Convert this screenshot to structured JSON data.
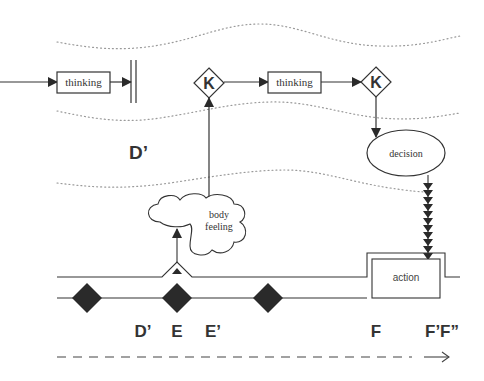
{
  "diagram": {
    "colors": {
      "line": "#333333",
      "fill": "#2a2a2a",
      "dotted": "#9a9a9a",
      "background": "#ffffff"
    },
    "top_row": {
      "nodes": [
        {
          "id": "thinking-1",
          "shape": "rect",
          "label": "thinking"
        },
        {
          "id": "block-bars",
          "shape": "double-bar",
          "label": ""
        },
        {
          "id": "k-1",
          "shape": "diamond",
          "label": "K"
        },
        {
          "id": "thinking-2",
          "shape": "rect",
          "label": "thinking"
        },
        {
          "id": "k-2",
          "shape": "diamond",
          "label": "K"
        }
      ]
    },
    "region_label": "D’",
    "decision": {
      "shape": "ellipse",
      "label": "decision"
    },
    "body_feeling": {
      "shape": "cloud",
      "line1": "body",
      "line2": "feeling"
    },
    "action": {
      "shape": "rect",
      "label": "action"
    },
    "timeline": {
      "markers": [
        {
          "id": "diamond-1"
        },
        {
          "id": "diamond-2"
        },
        {
          "id": "diamond-3"
        }
      ],
      "labels": {
        "d_prime": "D’",
        "e": "E",
        "e_prime": "E’",
        "f": "F",
        "f_prime_f_double": "F’F”"
      }
    },
    "icons": {
      "arrowhead": "filled-triangle-arrowhead",
      "chain_arrows": "stacked-down-arrowheads",
      "time_arrow": "dashed-right-arrow"
    }
  }
}
